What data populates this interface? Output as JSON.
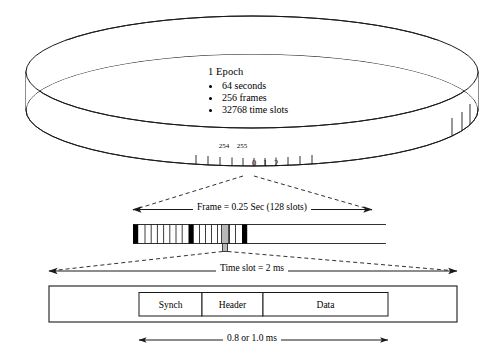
{
  "diagram": {
    "type": "timing-hierarchy-diagram"
  },
  "epoch": {
    "title": "1 Epoch",
    "bullets": [
      "64 seconds",
      "256 frames",
      "32768 time slots"
    ]
  },
  "ring": {
    "frame_labels_above": [
      "254",
      "255"
    ],
    "frame_cell_numbers": [
      "0",
      "1",
      "2"
    ]
  },
  "frame": {
    "label": "Frame = 0.25 Sec (128 slots)",
    "duration": "0.25 Sec",
    "slots": "128 slots"
  },
  "timeslot": {
    "label": "Time slot = 2 ms",
    "duration": "2 ms"
  },
  "packet": {
    "fields": [
      {
        "name": "Synch"
      },
      {
        "name": "Header"
      },
      {
        "name": "Data"
      }
    ],
    "burst_label": "0.8 or 1.0 ms"
  },
  "colors": {
    "line": "#1a1a1a",
    "fill_dark": "#000000",
    "fill_light": "#ffffff",
    "highlight": "#b8b8b8",
    "background": "#ffffff"
  }
}
